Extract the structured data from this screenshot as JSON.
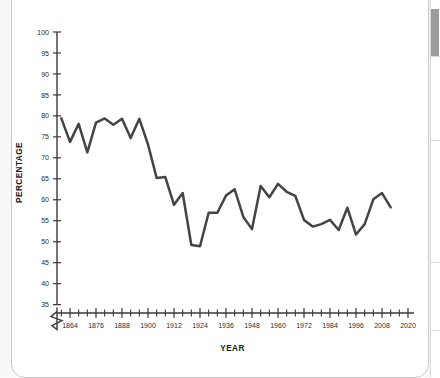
{
  "card": {
    "scrollbar": {
      "name": "vertical-scrollbar"
    },
    "divider": "dotted-rule"
  },
  "chart_data": {
    "type": "line",
    "title": "",
    "xlabel": "YEAR",
    "ylabel": "PERCENTAGE",
    "xlim": [
      1858,
      2020
    ],
    "ylim": [
      33,
      100
    ],
    "grid": false,
    "legend": "none",
    "axis_break": true,
    "line_color": "#444444",
    "y_ticks": [
      35,
      40,
      45,
      50,
      55,
      60,
      65,
      70,
      75,
      80,
      85,
      90,
      95,
      100
    ],
    "x_ticks": [
      1860,
      1864,
      1868,
      1872,
      1876,
      1880,
      1884,
      1888,
      1892,
      1896,
      1900,
      1904,
      1908,
      1912,
      1916,
      1920,
      1924,
      1928,
      1932,
      1936,
      1940,
      1944,
      1948,
      1952,
      1956,
      1960,
      1964,
      1968,
      1972,
      1976,
      1980,
      1984,
      1988,
      1992,
      1996,
      2000,
      2004,
      2008,
      2012,
      2016,
      2020
    ],
    "x_tick_labels": [
      1864,
      1876,
      1888,
      1900,
      1912,
      1924,
      1936,
      1948,
      1960,
      1972,
      1984,
      1996,
      2008,
      2020
    ],
    "x": [
      1860,
      1864,
      1868,
      1872,
      1876,
      1880,
      1884,
      1888,
      1892,
      1896,
      1900,
      1904,
      1908,
      1912,
      1916,
      1920,
      1924,
      1928,
      1932,
      1936,
      1940,
      1944,
      1948,
      1952,
      1956,
      1960,
      1964,
      1968,
      1972,
      1976,
      1980,
      1984,
      1988,
      1992,
      1996,
      2000,
      2004,
      2008,
      2012
    ],
    "values": [
      79.4,
      73.8,
      78.1,
      71.3,
      78.4,
      79.4,
      77.9,
      79.3,
      74.7,
      79.3,
      73.2,
      65.2,
      65.4,
      58.8,
      61.6,
      49.2,
      48.9,
      56.9,
      56.9,
      61.0,
      62.5,
      55.9,
      53.0,
      63.3,
      60.6,
      63.8,
      61.9,
      60.9,
      55.2,
      53.6,
      54.2,
      55.2,
      52.8,
      58.1,
      51.7,
      54.2,
      60.1,
      61.6,
      58.2
    ]
  }
}
